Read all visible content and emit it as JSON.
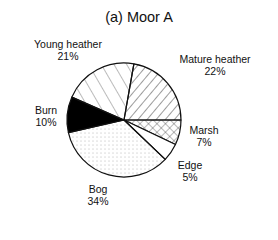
{
  "chart_data": {
    "type": "pie",
    "title": "(a) Moor A",
    "categories": [
      "Marsh",
      "Edge",
      "Bog",
      "Burn",
      "Young heather",
      "Mature heather"
    ],
    "values": [
      7,
      5,
      34,
      10,
      21,
      22
    ],
    "unit": "%",
    "patterns": {
      "Marsh": "crosshatch",
      "Edge": "white",
      "Bog": "dots",
      "Burn": "solid-black",
      "Young heather": "sparse-diagonal",
      "Mature heather": "dense-diagonal"
    },
    "labels": [
      {
        "name": "Young heather",
        "value": "21%"
      },
      {
        "name": "Mature heather",
        "value": "22%"
      },
      {
        "name": "Burn",
        "value": "10%"
      },
      {
        "name": "Marsh",
        "value": "7%"
      },
      {
        "name": "Edge",
        "value": "5%"
      },
      {
        "name": "Bog",
        "value": "34%"
      }
    ],
    "legend": "none (direct labels)"
  }
}
